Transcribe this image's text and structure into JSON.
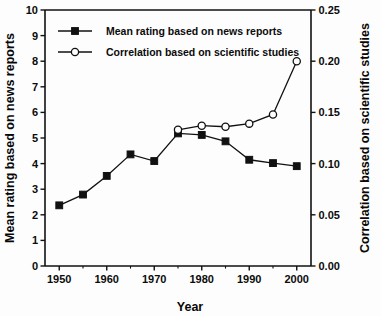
{
  "chart_data": {
    "type": "line",
    "title": "",
    "xlabel": "Year",
    "ylabel": "Mean rating based on news reports",
    "y2label": "Correlation based on scientific studies",
    "xlim": [
      1947,
      2003
    ],
    "ylim": [
      0,
      10
    ],
    "y2lim": [
      0.0,
      0.25
    ],
    "grid": false,
    "legend_position": "top-left inside plot",
    "x_ticks": [
      1950,
      1960,
      1970,
      1980,
      1990,
      2000
    ],
    "x_tick_labels": [
      "1950",
      "1960",
      "1970",
      "1980",
      "1990",
      "2000"
    ],
    "x_minor_ticks": [
      1955,
      1965,
      1975,
      1985,
      1995
    ],
    "y_ticks": [
      0,
      1,
      2,
      3,
      4,
      5,
      6,
      7,
      8,
      9,
      10
    ],
    "y_tick_labels": [
      "0",
      "1",
      "2",
      "3",
      "4",
      "5",
      "6",
      "7",
      "8",
      "9",
      "10"
    ],
    "y2_ticks": [
      0.0,
      0.05,
      0.1,
      0.15,
      0.2,
      0.25
    ],
    "y2_tick_labels": [
      "0.00",
      "0.05",
      "0.10",
      "0.15",
      "0.20",
      "0.25"
    ],
    "series": [
      {
        "name": "Mean rating based on news reports",
        "axis": "left",
        "marker": "filled-square",
        "x": [
          1950,
          1955,
          1960,
          1965,
          1970,
          1975,
          1980,
          1985,
          1990,
          1995,
          2000
        ],
        "values": [
          2.37,
          2.79,
          3.52,
          4.36,
          4.1,
          5.18,
          5.12,
          4.87,
          4.15,
          4.02,
          3.9
        ]
      },
      {
        "name": "Correlation based on scientific studies",
        "axis": "right",
        "marker": "open-circle",
        "x": [
          1975,
          1980,
          1985,
          1990,
          1995,
          2000
        ],
        "values": [
          0.133,
          0.137,
          0.136,
          0.139,
          0.148,
          0.2
        ]
      }
    ]
  },
  "legend": {
    "entries": [
      {
        "label": "Mean rating based on news reports",
        "marker": "filled-square"
      },
      {
        "label": "Correlation based on scientific studies",
        "marker": "open-circle"
      }
    ]
  },
  "colors": {
    "ink": "#111111",
    "background": "#fdfdfd",
    "marker_fill_open": "#ffffff"
  }
}
